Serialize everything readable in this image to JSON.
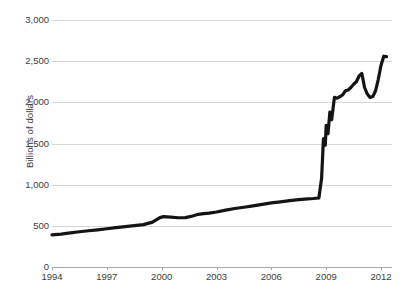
{
  "chart_data": {
    "type": "line",
    "title": "",
    "subtitle": "",
    "xlabel": "",
    "ylabel": "Billions of dollars",
    "xlim": [
      1994,
      2012.6
    ],
    "ylim": [
      0,
      3000
    ],
    "grid": true,
    "legend": "none",
    "y_ticks": [
      0,
      500,
      1000,
      1500,
      2000,
      2500,
      3000
    ],
    "y_tick_labels": [
      "0",
      "500",
      "1,000",
      "1,500",
      "2,000",
      "2,500",
      "3,000"
    ],
    "x_ticks": [
      1994,
      1997,
      2000,
      2003,
      2006,
      2009,
      2012
    ],
    "x_tick_labels": [
      "1994",
      "1997",
      "2000",
      "2003",
      "2006",
      "2009",
      "2012"
    ],
    "series": [
      {
        "name": "Total assets",
        "color": "#141414",
        "line_width": 3.2,
        "x": [
          1994.0,
          1994.5,
          1995.0,
          1995.5,
          1996.0,
          1996.5,
          1997.0,
          1997.5,
          1998.0,
          1998.5,
          1999.0,
          1999.5,
          1999.9,
          2000.1,
          2000.5,
          2000.9,
          2001.3,
          2001.7,
          2002.0,
          2002.3,
          2002.6,
          2003.0,
          2003.5,
          2004.0,
          2004.5,
          2005.0,
          2005.5,
          2006.0,
          2006.5,
          2007.0,
          2007.5,
          2008.0,
          2008.3,
          2008.6,
          2008.75,
          2008.85,
          2008.95,
          2009.0,
          2009.1,
          2009.2,
          2009.3,
          2009.45,
          2009.6,
          2009.75,
          2009.9,
          2010.05,
          2010.2,
          2010.35,
          2010.5,
          2010.65,
          2010.8,
          2010.95,
          2011.1,
          2011.25,
          2011.4,
          2011.55,
          2011.7,
          2011.85,
          2012.0,
          2012.15,
          2012.3
        ],
        "y": [
          390,
          400,
          415,
          428,
          440,
          452,
          465,
          478,
          490,
          502,
          515,
          545,
          600,
          612,
          605,
          598,
          600,
          620,
          640,
          648,
          655,
          668,
          690,
          710,
          726,
          742,
          760,
          778,
          792,
          806,
          818,
          828,
          832,
          838,
          1080,
          1560,
          1480,
          1720,
          1620,
          1880,
          1790,
          2060,
          2050,
          2070,
          2090,
          2140,
          2150,
          2180,
          2220,
          2250,
          2320,
          2350,
          2180,
          2100,
          2060,
          2070,
          2140,
          2280,
          2450,
          2560,
          2555
        ]
      }
    ],
    "annotations": []
  },
  "axis": {
    "y_title": "Billions of dollars"
  },
  "colors": {
    "gridline": "#d6d6d6",
    "axis": "#a8a8a8",
    "text": "#3c3c3c",
    "series": "#141414",
    "background": "#ffffff"
  }
}
